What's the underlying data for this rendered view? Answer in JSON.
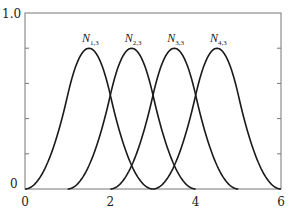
{
  "chart_data": {
    "type": "line",
    "title": "",
    "xlabel": "",
    "ylabel": "",
    "xlim": [
      0,
      6
    ],
    "ylim": [
      0,
      1.0
    ],
    "x_ticks": [
      0,
      2,
      4,
      6
    ],
    "x_tick_labels": [
      "0",
      "2",
      "4",
      "6"
    ],
    "y_tick_labels": [
      "0",
      "1.0"
    ],
    "y_minor_ticks": [
      0.2,
      0.4,
      0.6,
      0.8
    ],
    "grid": false,
    "legend": "inline labels above peaks",
    "series": [
      {
        "name": "N",
        "subscript": "1,3",
        "knots": [
          0,
          1,
          2,
          3
        ],
        "peak_x": 1.5,
        "peak_y": 0.8
      },
      {
        "name": "N",
        "subscript": "2,3",
        "knots": [
          1,
          2,
          3,
          4
        ],
        "peak_x": 2.5,
        "peak_y": 0.8
      },
      {
        "name": "N",
        "subscript": "3,3",
        "knots": [
          2,
          3,
          4,
          5
        ],
        "peak_x": 3.5,
        "peak_y": 0.8
      },
      {
        "name": "N",
        "subscript": "4,3",
        "knots": [
          3,
          4,
          5,
          6
        ],
        "peak_x": 4.5,
        "peak_y": 0.8
      }
    ]
  },
  "colors": {
    "curve": "#1a1a1a",
    "axis": "#777777"
  }
}
